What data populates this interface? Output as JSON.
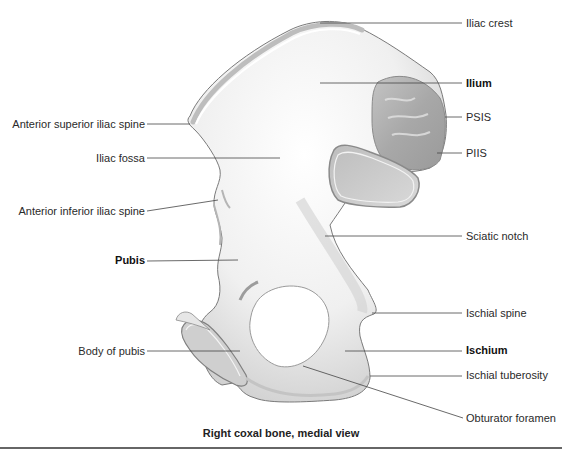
{
  "figure": {
    "caption": "Right coxal bone, medial view",
    "colors": {
      "bone_fill": "#f2f2f2",
      "bone_shade": "#c9c9c9",
      "rough_surface": "#a9a9a9",
      "outline": "#7a7a7a",
      "leader_line": "#444444",
      "rule": "#666666"
    }
  },
  "labels": {
    "right": [
      {
        "id": "iliac-crest",
        "text": "Iliac crest",
        "bold": false
      },
      {
        "id": "ilium",
        "text": "Ilium",
        "bold": true
      },
      {
        "id": "psis",
        "text": "PSIS",
        "bold": false
      },
      {
        "id": "piis",
        "text": "PIIS",
        "bold": false
      },
      {
        "id": "sciatic-notch",
        "text": "Sciatic notch",
        "bold": false
      },
      {
        "id": "ischial-spine",
        "text": "Ischial spine",
        "bold": false
      },
      {
        "id": "ischium",
        "text": "Ischium",
        "bold": true
      },
      {
        "id": "ischial-tuberosity",
        "text": "Ischial tuberosity",
        "bold": false
      },
      {
        "id": "obturator-foramen",
        "text": "Obturator foramen",
        "bold": false
      }
    ],
    "left": [
      {
        "id": "asis",
        "text": "Anterior superior iliac spine",
        "bold": false
      },
      {
        "id": "iliac-fossa",
        "text": "Iliac fossa",
        "bold": false
      },
      {
        "id": "aiis",
        "text": "Anterior inferior iliac spine",
        "bold": false
      },
      {
        "id": "pubis",
        "text": "Pubis",
        "bold": true
      },
      {
        "id": "body-of-pubis",
        "text": "Body of pubis",
        "bold": false
      }
    ]
  }
}
